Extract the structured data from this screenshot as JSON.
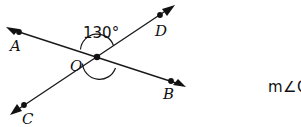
{
  "figure": {
    "type": "intersecting-lines-angle-diagram",
    "angle_label": "130°",
    "vertex_label": "O",
    "points": [
      {
        "name": "A",
        "label": "A"
      },
      {
        "name": "B",
        "label": "B"
      },
      {
        "name": "C",
        "label": "C"
      },
      {
        "name": "D",
        "label": "D"
      }
    ],
    "lines": [
      {
        "name": "line-AB",
        "from": "A",
        "through": "O",
        "to": "B"
      },
      {
        "name": "line-CD",
        "from": "C",
        "through": "O",
        "to": "D"
      }
    ],
    "arcs": [
      {
        "name": "angle-arc-upper",
        "measure": "130°"
      },
      {
        "name": "angle-arc-lower",
        "measure": ""
      }
    ],
    "colors": {
      "stroke": "#1a1a1a",
      "background": "#ffffff",
      "text": "#111111"
    }
  },
  "question": {
    "prompt": "m∠C"
  }
}
